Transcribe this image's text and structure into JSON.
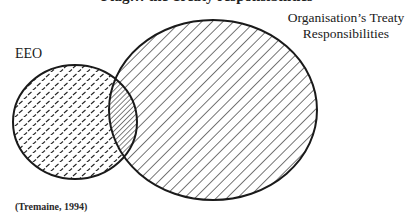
{
  "diagram": {
    "type": "venn",
    "title_partial": "Flag… the Treaty responsibilities",
    "sets": [
      {
        "id": "eeo",
        "label": "EEO",
        "pattern": "dashed-tread",
        "stroke_color": "#1a1a1a"
      },
      {
        "id": "treaty",
        "label_lines": [
          "Organisation’s Treaty",
          "Responsibilities"
        ],
        "pattern": "diagonal-hatch",
        "stroke_color": "#1a1a1a"
      }
    ],
    "overlap": {
      "sets": [
        "eeo",
        "treaty"
      ],
      "pattern": "dense-diagonal-hatch"
    },
    "citation": "(Tremaine, 1994)"
  }
}
